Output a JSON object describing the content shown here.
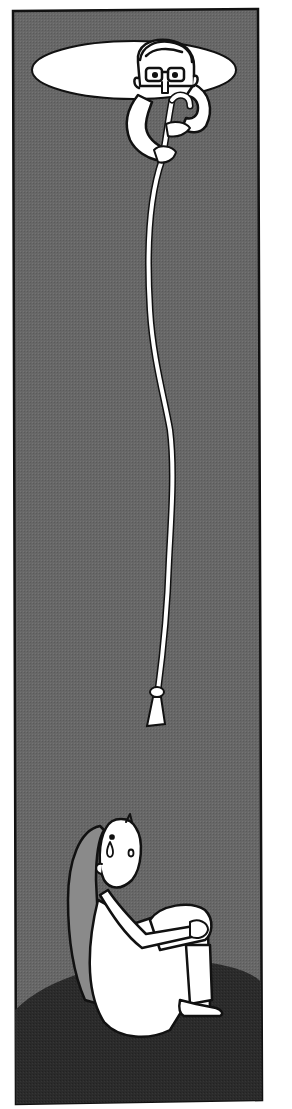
{
  "illustration": {
    "description": "Vertical comic panel: a man with glasses peers down through a bright oval hole at the top and lowers a long white rope into a dark pit, where a crying girl with long hair sits hugging her knees on a dark floor.",
    "colors": {
      "page_background": "#ffffff",
      "pit_wall": "#666666",
      "pit_floor": "#2a2a2a",
      "hole_light": "#ffffff",
      "outline": "#111111",
      "figure_fill": "#ffffff",
      "hair": "#8a8a8a"
    },
    "elements": [
      {
        "name": "opening-oval",
        "label": "Light opening at top of pit"
      },
      {
        "name": "man-with-glasses",
        "label": "Man peering down holding rope"
      },
      {
        "name": "rope",
        "label": "Long white rope with knotted tassel end"
      },
      {
        "name": "crying-girl",
        "label": "Girl with long hair sitting hugging knees, teardrop on face"
      },
      {
        "name": "pit-floor",
        "label": "Dark floor area"
      }
    ]
  }
}
